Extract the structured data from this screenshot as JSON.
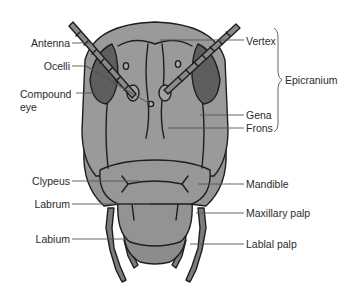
{
  "labels_left": [
    {
      "id": "antenna",
      "text": "Antenna"
    },
    {
      "id": "ocelli",
      "text": "Ocelli"
    },
    {
      "id": "compound-eye",
      "text": "Compound",
      "text2": "eye"
    },
    {
      "id": "clypeus",
      "text": "Clypeus"
    },
    {
      "id": "labrum",
      "text": "Labrum"
    },
    {
      "id": "labium",
      "text": "Labium"
    }
  ],
  "labels_right": [
    {
      "id": "vertex",
      "text": "Vertex"
    },
    {
      "id": "gena",
      "text": "Gena"
    },
    {
      "id": "frons",
      "text": "Frons"
    },
    {
      "id": "mandible",
      "text": "Mandible"
    },
    {
      "id": "maxillary-palp",
      "text": "Maxillary palp"
    },
    {
      "id": "labial-palp",
      "text": "Lablal palp"
    }
  ],
  "bracket_label": {
    "text": "Epicranium",
    "spans": [
      "Vertex",
      "Gena",
      "Frons"
    ]
  },
  "colors": {
    "head_fill": "#9a9a9a",
    "eye_fill": "#5e5e5e",
    "outline": "#1e1e1e",
    "leader_line": "#555555",
    "text": "#2b2b2b"
  }
}
